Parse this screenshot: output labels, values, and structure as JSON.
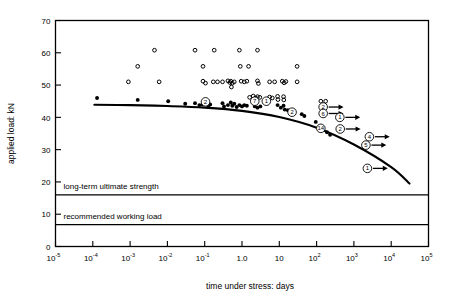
{
  "chart_data": {
    "type": "scatter",
    "title": "",
    "xlabel": "time under stress: days",
    "ylabel": "applied load: kN",
    "xscale": "log",
    "xlim": [
      1e-05,
      100000.0
    ],
    "ylim": [
      0,
      70
    ],
    "yticks": [
      0,
      10,
      20,
      30,
      40,
      50,
      60,
      70
    ],
    "xticks": [
      {
        "label": "10",
        "sup": "-5",
        "value": 1e-05
      },
      {
        "label": "10",
        "sup": "-4",
        "value": 0.0001
      },
      {
        "label": "10",
        "sup": "-3",
        "value": 0.001
      },
      {
        "label": "10",
        "sup": "-2",
        "value": 0.01
      },
      {
        "label": "10",
        "sup": "-1",
        "value": 0.1
      },
      {
        "label": "1.0",
        "sup": "",
        "value": 1
      },
      {
        "label": "10",
        "sup": "",
        "value": 10
      },
      {
        "label": "10",
        "sup": "2",
        "value": 100
      },
      {
        "label": "10",
        "sup": "3",
        "value": 1000
      },
      {
        "label": "10",
        "sup": "4",
        "value": 10000
      },
      {
        "label": "10",
        "sup": "5",
        "value": 100000
      }
    ],
    "grid": false,
    "legend": "none",
    "reference_lines": [
      {
        "name": "long-term ultimate strength",
        "label": "long-term ultimate strength",
        "y": 16.0
      },
      {
        "name": "recommended working load",
        "label": "recommended working load",
        "y": 6.8
      }
    ],
    "series": [
      {
        "name": "unfailed specimens (open circles)",
        "marker": "open-circle",
        "points": [
          [
            0.0045,
            60.8
          ],
          [
            0.055,
            60.8
          ],
          [
            0.18,
            60.8
          ],
          [
            0.85,
            60.8
          ],
          [
            2.6,
            60.8
          ],
          [
            0.0016,
            55.8
          ],
          [
            0.09,
            55.8
          ],
          [
            0.9,
            55.8
          ],
          [
            1.5,
            55.8
          ],
          [
            30.0,
            55.8
          ],
          [
            0.0009,
            51.0
          ],
          [
            0.006,
            51.0
          ],
          [
            0.09,
            51.2
          ],
          [
            0.105,
            50.6
          ],
          [
            0.17,
            51.0
          ],
          [
            0.22,
            51.0
          ],
          [
            0.3,
            51.0
          ],
          [
            0.42,
            51.3
          ],
          [
            0.47,
            50.8
          ],
          [
            0.5,
            51.2
          ],
          [
            0.55,
            50.6
          ],
          [
            0.62,
            51.0
          ],
          [
            0.52,
            49.4
          ],
          [
            0.95,
            51.2
          ],
          [
            1.15,
            51.0
          ],
          [
            1.35,
            51.2
          ],
          [
            2.6,
            51.3
          ],
          [
            2.75,
            50.5
          ],
          [
            5.5,
            51.0
          ],
          [
            7.5,
            51.0
          ],
          [
            12.0,
            51.2
          ],
          [
            13.5,
            50.7
          ],
          [
            15.0,
            51.1
          ],
          [
            30.0,
            51.0
          ],
          [
            1.6,
            46.2
          ],
          [
            2.0,
            46.6
          ],
          [
            2.3,
            46.0
          ],
          [
            2.6,
            46.4
          ],
          [
            3.0,
            46.2
          ],
          [
            5.5,
            46.3
          ],
          [
            6.5,
            46.0
          ],
          [
            9.0,
            46.5
          ],
          [
            9.2,
            45.5
          ],
          [
            13.0,
            46.4
          ],
          [
            13.2,
            45.4
          ],
          [
            130.0,
            45.0
          ],
          [
            175.0,
            45.0
          ]
        ]
      },
      {
        "name": "failed specimens (filled circles)",
        "marker": "filled-circle",
        "points": [
          [
            0.00013,
            46.0
          ],
          [
            0.0016,
            45.4
          ],
          [
            0.0105,
            45.0
          ],
          [
            0.03,
            44.2
          ],
          [
            0.055,
            44.4
          ],
          [
            0.072,
            43.8
          ],
          [
            0.088,
            44.0
          ],
          [
            0.105,
            44.2
          ],
          [
            0.125,
            43.6
          ],
          [
            0.14,
            44.0
          ],
          [
            0.3,
            44.4
          ],
          [
            0.33,
            43.4
          ],
          [
            0.42,
            43.8
          ],
          [
            0.5,
            44.6
          ],
          [
            0.55,
            43.6
          ],
          [
            0.62,
            44.2
          ],
          [
            0.72,
            43.2
          ],
          [
            0.85,
            43.8
          ],
          [
            1.0,
            43.4
          ],
          [
            1.15,
            43.8
          ],
          [
            1.35,
            43.6
          ],
          [
            2.2,
            43.4
          ],
          [
            2.6,
            43.0
          ],
          [
            3.1,
            43.4
          ],
          [
            9.0,
            43.8
          ],
          [
            11.0,
            43.0
          ],
          [
            13.0,
            43.6
          ],
          [
            14.0,
            42.4
          ],
          [
            17.0,
            42.2
          ],
          [
            20.0,
            41.8
          ],
          [
            40.0,
            41.0
          ],
          [
            47.0,
            40.4
          ],
          [
            95.0,
            38.6
          ],
          [
            120.0,
            36.8
          ],
          [
            190.0,
            35.4
          ],
          [
            230.0,
            34.6
          ]
        ]
      }
    ],
    "trend_curve": {
      "name": "mean strength regression curve",
      "points": [
        [
          0.00011,
          43.9
        ],
        [
          0.001,
          43.8
        ],
        [
          0.01,
          43.5
        ],
        [
          0.1,
          43.0
        ],
        [
          1.0,
          42.0
        ],
        [
          10.0,
          40.1
        ],
        [
          100.0,
          36.8
        ],
        [
          1000.0,
          31.6
        ],
        [
          10000.0,
          24.6
        ],
        [
          31000.0,
          19.5
        ]
      ]
    },
    "annotations": [
      {
        "name": "ann-2-upper-left",
        "label": "2",
        "x": 0.105,
        "y": 44.8,
        "arrow": false
      },
      {
        "name": "ann-7",
        "label": "7",
        "x": 2.2,
        "y": 45.0,
        "arrow": false
      },
      {
        "name": "ann-1-left",
        "label": "1",
        "x": 4.5,
        "y": 45.0,
        "arrow": false
      },
      {
        "name": "ann-2-curve",
        "label": "2",
        "x": 22.0,
        "y": 41.6,
        "arrow": false
      },
      {
        "name": "ann-2-right-upper",
        "label": "2",
        "x": 150.0,
        "y": 43.2,
        "arrow": true
      },
      {
        "name": "ann-6",
        "label": "6",
        "x": 150.0,
        "y": 41.2,
        "arrow": true
      },
      {
        "name": "ann-1-mid",
        "label": "1",
        "x": 420.0,
        "y": 40.0,
        "arrow": true
      },
      {
        "name": "ann-14",
        "label": "14",
        "x": 130.0,
        "y": 36.6,
        "arrow": false
      },
      {
        "name": "ann-2-lower",
        "label": "2",
        "x": 430.0,
        "y": 36.4,
        "arrow": true
      },
      {
        "name": "ann-4",
        "label": "4",
        "x": 2600.0,
        "y": 34.0,
        "arrow": true
      },
      {
        "name": "ann-5",
        "label": "5",
        "x": 2100.0,
        "y": 31.4,
        "arrow": true
      },
      {
        "name": "ann-1-bottom",
        "label": "1",
        "x": 2300.0,
        "y": 24.2,
        "arrow": true
      }
    ]
  }
}
